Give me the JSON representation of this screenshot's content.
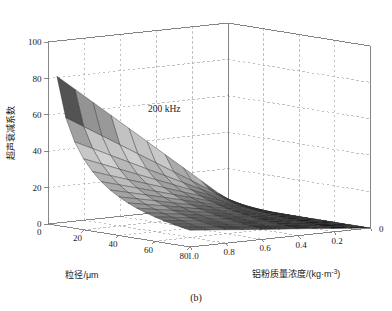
{
  "figure": {
    "caption": "(b)",
    "annotation": "200 kHz"
  },
  "axes": {
    "z": {
      "title": "超声衰减系数",
      "ticks": [
        "100",
        "80",
        "60",
        "40",
        "20",
        "0"
      ],
      "values": [
        100,
        80,
        60,
        40,
        20,
        0
      ],
      "range": [
        0,
        100
      ]
    },
    "x": {
      "title": "粒径/μm",
      "ticks": [
        "20",
        "40",
        "60",
        "80"
      ],
      "values": [
        20,
        40,
        60,
        80
      ],
      "origin_tick": "0",
      "range": [
        0,
        80
      ]
    },
    "y": {
      "title_main": "铝粉质量浓度/(kg·m",
      "title_sup": "-3",
      "title_tail": ")",
      "title": "铝粉质量浓度/(kg·m-3)",
      "ticks": [
        "1.0",
        "0.8",
        "0.6",
        "0.4",
        "0.2",
        "0"
      ],
      "values": [
        1.0,
        0.8,
        0.6,
        0.4,
        0.2,
        0
      ],
      "range": [
        0,
        1.0
      ]
    }
  },
  "style": {
    "axis_color": "#7a7a7a",
    "grid_color": "#9a9a9a",
    "mesh_color": "#2a2a2a",
    "background": "#ffffff"
  },
  "chart_data": {
    "type": "surface",
    "title": "",
    "annotation": "200 kHz",
    "xlabel": "粒径/μm",
    "ylabel": "铝粉质量浓度/(kg·m-3)",
    "zlabel": "超声衰减系数",
    "xlim": [
      0,
      80
    ],
    "ylim": [
      0,
      1.0
    ],
    "zlim": [
      0,
      100
    ],
    "grid": true,
    "legend": "none",
    "colormap": "gray",
    "view": {
      "azimuth": -37.5,
      "elevation": 22
    },
    "x": [
      5,
      10,
      15,
      20,
      25,
      30,
      35,
      40,
      45,
      50,
      55,
      60,
      65,
      70,
      75,
      80
    ],
    "y": [
      1.0,
      0.9,
      0.8,
      0.7,
      0.6,
      0.5,
      0.4,
      0.3,
      0.2,
      0.1,
      0.0
    ],
    "z_note": "z = ultrasonic attenuation coefficient; decreases with larger particle diameter and with lower aluminium powder mass concentration; peak ~82 at x=5um, y=1.0 kg/m3; falls to ~0 at y=0 and at large x.",
    "z": [
      [
        82.0,
        73.8,
        65.6,
        57.4,
        49.2,
        41.0,
        32.8,
        24.6,
        16.4,
        8.2,
        0.0
      ],
      [
        60.0,
        54.0,
        48.0,
        42.0,
        36.0,
        30.0,
        24.0,
        18.0,
        12.0,
        6.0,
        0.0
      ],
      [
        47.5,
        42.8,
        38.0,
        33.3,
        28.5,
        23.8,
        19.0,
        14.3,
        9.5,
        4.8,
        0.0
      ],
      [
        39.0,
        35.1,
        31.2,
        27.3,
        23.4,
        19.5,
        15.6,
        11.7,
        7.8,
        3.9,
        0.0
      ],
      [
        32.8,
        29.5,
        26.2,
        23.0,
        19.7,
        16.4,
        13.1,
        9.8,
        6.6,
        3.3,
        0.0
      ],
      [
        28.0,
        25.2,
        22.4,
        19.6,
        16.8,
        14.0,
        11.2,
        8.4,
        5.6,
        2.8,
        0.0
      ],
      [
        24.2,
        21.8,
        19.4,
        17.0,
        14.5,
        12.1,
        9.7,
        7.3,
        4.8,
        2.4,
        0.0
      ],
      [
        21.2,
        19.1,
        17.0,
        14.8,
        12.7,
        10.6,
        8.5,
        6.4,
        4.2,
        2.1,
        0.0
      ],
      [
        18.7,
        16.8,
        15.0,
        13.1,
        11.2,
        9.4,
        7.5,
        5.6,
        3.7,
        1.9,
        0.0
      ],
      [
        16.6,
        14.9,
        13.3,
        11.6,
        10.0,
        8.3,
        6.6,
        5.0,
        3.3,
        1.7,
        0.0
      ],
      [
        14.9,
        13.4,
        11.9,
        10.4,
        8.9,
        7.4,
        6.0,
        4.5,
        3.0,
        1.5,
        0.0
      ],
      [
        13.4,
        12.1,
        10.7,
        9.4,
        8.0,
        6.7,
        5.4,
        4.0,
        2.7,
        1.3,
        0.0
      ],
      [
        12.1,
        10.9,
        9.7,
        8.5,
        7.3,
        6.1,
        4.8,
        3.6,
        2.4,
        1.2,
        0.0
      ],
      [
        11.0,
        9.9,
        8.8,
        7.7,
        6.6,
        5.5,
        4.4,
        3.3,
        2.2,
        1.1,
        0.0
      ],
      [
        10.1,
        9.1,
        8.1,
        7.0,
        6.0,
        5.0,
        4.0,
        3.0,
        2.0,
        1.0,
        0.0
      ],
      [
        9.2,
        8.3,
        7.4,
        6.4,
        5.5,
        4.6,
        3.7,
        2.8,
        1.8,
        0.9,
        0.0
      ]
    ]
  }
}
